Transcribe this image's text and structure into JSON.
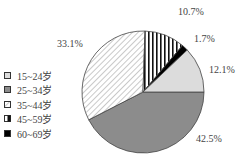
{
  "chart_data": {
    "type": "pie",
    "title": "",
    "categories": [
      "15~24岁",
      "25~34岁",
      "35~44岁",
      "45~59岁",
      "60~69岁"
    ],
    "values": [
      12.1,
      42.5,
      33.1,
      10.7,
      1.7
    ],
    "labels": [
      "12.1%",
      "42.5%",
      "33.1%",
      "10.7%",
      "1.7%"
    ],
    "fills": [
      "light-gray",
      "dark-gray",
      "diagonal-hatch",
      "vertical-stripes",
      "black"
    ],
    "colors": [
      "#dcdcdc",
      "#8c8c8c",
      "#ffffff",
      "#ffffff",
      "#000000"
    ],
    "start_angle": "3 o'clock, clockwise starting with 25~34岁",
    "legend_position": "left"
  },
  "legend": [
    {
      "label": "15~24岁"
    },
    {
      "label": "25~34岁"
    },
    {
      "label": "35~44岁"
    },
    {
      "label": "45~59岁"
    },
    {
      "label": "60~69岁"
    }
  ],
  "slice_labels": {
    "a": "12.1%",
    "b": "42.5%",
    "c": "33.1%",
    "d": "10.7%",
    "e": "1.7%"
  }
}
